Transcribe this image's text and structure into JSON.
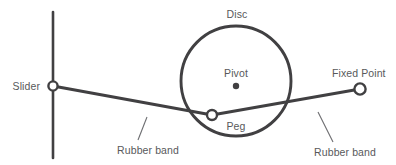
{
  "figure": {
    "type": "mechanism-diagram",
    "background_color": "#ffffff",
    "line_color": "#414042",
    "label_color": "#58595b",
    "width": 396,
    "height": 165
  },
  "labels": {
    "slider": "Slider",
    "disc": "Disc",
    "pivot": "Pivot",
    "peg": "Peg",
    "fixed_point": "Fixed Point",
    "rubber_band_left": "Rubber band",
    "rubber_band_right": "Rubber band"
  },
  "geometry": {
    "slider_track": {
      "x": 53,
      "y_top": 12,
      "y_bottom": 158
    },
    "slider_marker": {
      "cx": 53,
      "cy": 86,
      "r": 4.6,
      "style": "open-circle"
    },
    "disc": {
      "cx": 236,
      "cy": 81,
      "r": 55,
      "style": "circle-outline"
    },
    "pivot_marker": {
      "cx": 236,
      "cy": 86,
      "r": 3.2,
      "style": "filled-dot"
    },
    "peg_marker": {
      "cx": 212,
      "cy": 115,
      "r": 5.0,
      "style": "open-circle"
    },
    "fixed_point_marker": {
      "cx": 360,
      "cy": 89,
      "r": 5.6,
      "style": "open-circle"
    },
    "band_left_segment": {
      "x1": 53,
      "y1": 86,
      "x2": 212,
      "y2": 115
    },
    "band_right_segment": {
      "x1": 212,
      "y1": 115,
      "x2": 360,
      "y2": 89
    },
    "leader_left": {
      "x1": 147,
      "y1": 117,
      "x2": 138,
      "y2": 140
    },
    "leader_right": {
      "x1": 318,
      "y1": 112,
      "x2": 333,
      "y2": 142
    }
  },
  "label_positions": {
    "slider": {
      "x": 40,
      "y": 90
    },
    "disc": {
      "x": 237,
      "y": 18
    },
    "pivot": {
      "x": 236,
      "y": 77
    },
    "peg": {
      "x": 236,
      "y": 130
    },
    "fixed_point": {
      "x": 364,
      "y": 77
    },
    "rubber_band_left": {
      "x": 148,
      "y": 154
    },
    "rubber_band_right": {
      "x": 345,
      "y": 156
    }
  }
}
